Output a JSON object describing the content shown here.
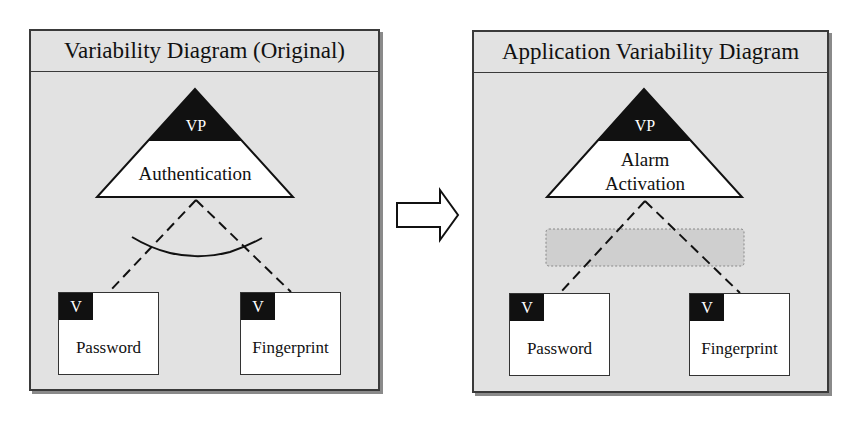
{
  "left_panel": {
    "title": "Variability Diagram (Original)",
    "variation_point": {
      "tag": "VP",
      "name": "Authentication"
    },
    "variants": [
      {
        "tag": "V",
        "name": "Password"
      },
      {
        "tag": "V",
        "name": "Fingerprint"
      }
    ],
    "constraint": "alternative-arc"
  },
  "transition_arrow": {
    "icon": "right-arrow-icon"
  },
  "right_panel": {
    "title": "Application Variability Diagram",
    "variation_point": {
      "tag": "VP",
      "name_line1": "Alarm",
      "name_line2": "Activation"
    },
    "variants": [
      {
        "tag": "V",
        "name": "Password"
      },
      {
        "tag": "V",
        "name": "Fingerprint"
      }
    ],
    "constraint": "removed-placeholder"
  },
  "colors": {
    "panel_bg": "#e2e2e2",
    "border": "#3a3a3a",
    "black_fill": "#111111",
    "placeholder_fill": "#cfcfcf"
  }
}
